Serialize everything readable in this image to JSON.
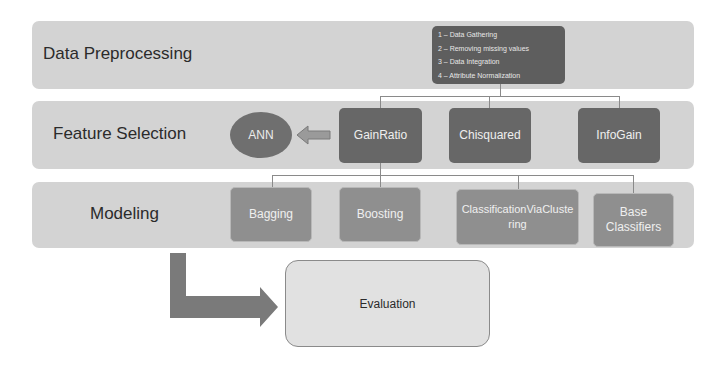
{
  "stages": [
    {
      "label": "Data Preprocessing"
    },
    {
      "label": "Feature Selection"
    },
    {
      "label": "Modeling"
    }
  ],
  "preprocessing_steps": [
    "1 – Data Gathering",
    "2 – Removing missing values",
    "3 – Data Integration",
    "4 – Attribute Normalization"
  ],
  "feature_selection": {
    "methods": [
      "GainRatio",
      "Chisquared",
      "InfoGain"
    ],
    "ann_label": "ANN"
  },
  "modeling": {
    "methods": [
      "Bagging",
      "Boosting",
      "ClassificationViaClustering",
      "Base Classifiers"
    ]
  },
  "evaluation": {
    "label": "Evaluation"
  },
  "colors": {
    "band": "#d3d3d3",
    "dark_node": "#676767",
    "mid_node": "#8f8f8f",
    "arrow": "#7a7a7a",
    "evaluation_fill": "#e1e1e1"
  }
}
